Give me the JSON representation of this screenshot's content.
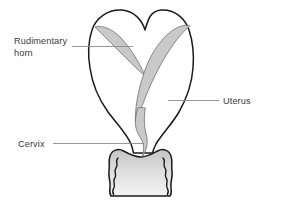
{
  "figure": {
    "background_color": "#ffffff",
    "outline_color": "#1a1a1a",
    "cavity_fill_color": "#c9c9c9",
    "cavity_stroke_color": "#6e6e6e",
    "leader_line_color": "#8a8a8a",
    "text_color": "#3a3a3a"
  },
  "labels": {
    "rudimentary_horn": {
      "line1": "Rudimentary",
      "line2": "horn"
    },
    "uterus": {
      "text": "Uterus"
    },
    "cervix": {
      "text": "Cervix"
    }
  },
  "parts": [
    {
      "name": "rudimentary-horn-cavity",
      "shaded": true
    },
    {
      "name": "uterine-cavity",
      "shaded": true
    },
    {
      "name": "cervical-canal",
      "shaded": true
    },
    {
      "name": "uterus-outline",
      "shaded": false
    },
    {
      "name": "vagina",
      "shaded": true
    }
  ]
}
